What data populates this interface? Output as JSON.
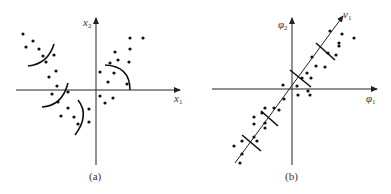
{
  "panels": [
    {
      "id": "a",
      "caption": "(a)",
      "x_axis_label": "x",
      "x_axis_sub": "1",
      "y_axis_label": "x",
      "y_axis_sub": "2",
      "origin": [
        96,
        90
      ],
      "points": [
        [
          23,
          34
        ],
        [
          26,
          47
        ],
        [
          33,
          41
        ],
        [
          39,
          49
        ],
        [
          43,
          56
        ],
        [
          46,
          62
        ],
        [
          54,
          55
        ],
        [
          56,
          71
        ],
        [
          49,
          77
        ],
        [
          57,
          86
        ],
        [
          52,
          94
        ],
        [
          68,
          92
        ],
        [
          58,
          102
        ],
        [
          68,
          108
        ],
        [
          61,
          116
        ],
        [
          74,
          117
        ],
        [
          78,
          124
        ],
        [
          89,
          109
        ],
        [
          89,
          122
        ],
        [
          100,
          72
        ],
        [
          108,
          82
        ],
        [
          110,
          63
        ],
        [
          115,
          52
        ],
        [
          118,
          60
        ],
        [
          114,
          73
        ],
        [
          130,
          38
        ],
        [
          130,
          49
        ],
        [
          129,
          62
        ],
        [
          143,
          38
        ],
        [
          127,
          84
        ],
        [
          100,
          96
        ],
        [
          105,
          103
        ],
        [
          113,
          98
        ]
      ]
    },
    {
      "id": "b",
      "caption": "(b)",
      "x_axis_label": "φ",
      "x_axis_sub": "1",
      "y_axis_label": "φ",
      "y_axis_sub": "2",
      "principal_axis_label": "v",
      "principal_axis_sub": "1",
      "origin": [
        292,
        89
      ],
      "points": [
        [
          330,
          31
        ],
        [
          342,
          34
        ],
        [
          354,
          38
        ],
        [
          339,
          43
        ],
        [
          339,
          46
        ],
        [
          328,
          53
        ],
        [
          336,
          55
        ],
        [
          312,
          57
        ],
        [
          316,
          66
        ],
        [
          325,
          67
        ],
        [
          307,
          73
        ],
        [
          302,
          78
        ],
        [
          311,
          78
        ],
        [
          283,
          85
        ],
        [
          297,
          86
        ],
        [
          308,
          91
        ],
        [
          310,
          95
        ],
        [
          298,
          95
        ],
        [
          284,
          99
        ],
        [
          274,
          108
        ],
        [
          265,
          108
        ],
        [
          262,
          113
        ],
        [
          279,
          110
        ],
        [
          254,
          117
        ],
        [
          265,
          123
        ],
        [
          265,
          128
        ],
        [
          254,
          124
        ],
        [
          254,
          137
        ],
        [
          242,
          141
        ],
        [
          234,
          146
        ],
        [
          257,
          141
        ],
        [
          242,
          154
        ],
        [
          240,
          163
        ]
      ]
    }
  ]
}
